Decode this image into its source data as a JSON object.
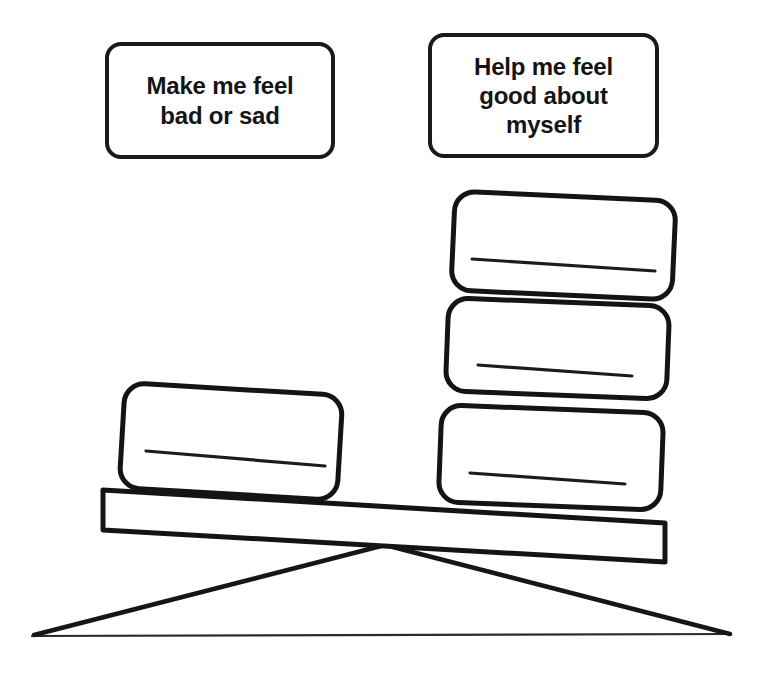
{
  "diagram": {
    "title": "Balance scale weighing people who make me feel bad versus people who help me feel good",
    "type": "seesaw-balance",
    "stroke_color": "#1a1a1a",
    "background_color": "#ffffff",
    "ground_line_color": "#2b2b2b"
  },
  "headers": {
    "left": {
      "text": "Make me feel\nbad or sad",
      "lines": [
        "Make me feel",
        "bad or sad"
      ]
    },
    "right": {
      "text": "Help me feel\ngood about\nmyself",
      "lines": [
        "Help me feel",
        "good about",
        "myself"
      ]
    }
  },
  "left_side": {
    "count": 1,
    "cards": [
      {
        "id": "left-card-1",
        "text": "",
        "has_write_line": true
      }
    ]
  },
  "right_side": {
    "count": 3,
    "cards": [
      {
        "id": "right-card-top",
        "text": "",
        "has_write_line": true
      },
      {
        "id": "right-card-middle",
        "text": "",
        "has_write_line": true
      },
      {
        "id": "right-card-bottom",
        "text": "",
        "has_write_line": true
      }
    ]
  },
  "beam": {
    "tilt": "right-side-down",
    "left_end_y": 490,
    "right_end_y": 523
  },
  "fulcrum": {
    "shape": "triangle",
    "apex_x": 385,
    "apex_y": 545,
    "base_left_x": 32,
    "base_right_x": 731,
    "base_y": 636
  }
}
